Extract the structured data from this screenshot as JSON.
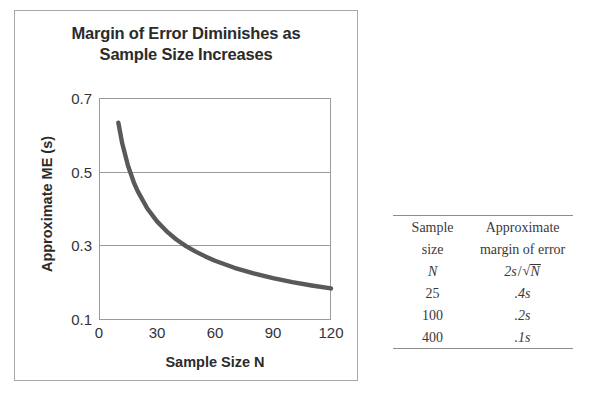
{
  "chart_panel": {
    "title_line1": "Margin of Error Diminishes as",
    "title_line2": "Sample Size Increases",
    "y_axis_title": "Approximate ME (s)",
    "x_axis_title": "Sample Size N"
  },
  "table": {
    "header": {
      "col1_line1": "Sample",
      "col1_line2": "size",
      "col2_line1": "Approximate",
      "col2_line2": "margin of error"
    },
    "formula_row": {
      "symbol": "N",
      "coefficient": "2s",
      "slash": "/",
      "radical_sign": "√",
      "radicand": "N"
    },
    "rows": [
      {
        "sample_size": "25",
        "margin_of_error": ".4s"
      },
      {
        "sample_size": "100",
        "margin_of_error": ".2s"
      },
      {
        "sample_size": "400",
        "margin_of_error": ".1s"
      }
    ]
  },
  "colors": {
    "curve": "#595959",
    "gridline": "#9a9a9a",
    "panel_border": "#a8a8a8",
    "table_rule": "#8d8d8d",
    "text": "#2b2b2b"
  },
  "chart_data": {
    "type": "line",
    "title": "Margin of Error Diminishes as Sample Size Increases",
    "xlabel": "Sample Size N",
    "ylabel": "Approximate ME (s)",
    "xlim": [
      0,
      120
    ],
    "ylim": [
      0.1,
      0.7
    ],
    "xticks": [
      0,
      30,
      60,
      90,
      120
    ],
    "yticks": [
      0.1,
      0.3,
      0.5,
      0.7
    ],
    "ytick_labels": [
      "0.1",
      "0.3",
      "0.5",
      "0.7"
    ],
    "xtick_labels": [
      "0",
      "30",
      "60",
      "90",
      "120"
    ],
    "grid": "horizontal",
    "legend": "none",
    "series": [
      {
        "name": "Approximate margin of error 2s/sqrt(N)",
        "formula": "ME = 2/sqrt(N)",
        "x": [
          10,
          12,
          15,
          18,
          20,
          25,
          30,
          35,
          40,
          45,
          50,
          55,
          60,
          70,
          80,
          90,
          100,
          110,
          120
        ],
        "y": [
          0.633,
          0.577,
          0.516,
          0.471,
          0.447,
          0.4,
          0.365,
          0.338,
          0.316,
          0.298,
          0.283,
          0.27,
          0.258,
          0.239,
          0.224,
          0.211,
          0.2,
          0.191,
          0.183
        ]
      }
    ]
  }
}
